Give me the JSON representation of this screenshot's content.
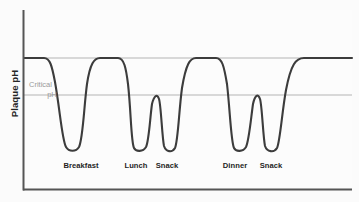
{
  "chart_data": {
    "type": "line",
    "title": "Frequent Consumption",
    "xlabel": "",
    "ylabel": "Plaque pH",
    "grid": false,
    "legend": "none",
    "x_tick_labels": [
      "Breakfast",
      "Lunch",
      "Snack",
      "Dinner",
      "Snack"
    ],
    "x_tick_positions_px": [
      81,
      136,
      167,
      235,
      271
    ],
    "reference_lines": [
      {
        "name": "resting-ph",
        "label": "",
        "y_px": 58,
        "color": "#b4b4b4"
      },
      {
        "name": "critical-ph",
        "label": "Critical pH",
        "y_px": 95,
        "color": "#b4b4b4"
      }
    ],
    "annotations": [
      {
        "name": "critical-ph-annotation",
        "line1": "Critical",
        "line2": "pH",
        "x_px": 41,
        "y_px": 88,
        "color": "#9a9a9a"
      }
    ],
    "series": [
      {
        "name": "plaque-ph-curve",
        "color": "#3c3c3c",
        "width_px": 2.1,
        "description": "Stephan curve: plaque pH drops below the critical pH after each eating event and recovers between events; frequent snacking keeps pH below critical for long periods.",
        "events": [
          {
            "label": "Breakfast",
            "trough_x_px": 72,
            "trough_y_px": 150,
            "recovers_to": "resting"
          },
          {
            "label": "Lunch",
            "trough_x_px": 136,
            "trough_y_px": 150,
            "recovers_to": "critical"
          },
          {
            "label": "Snack",
            "trough_x_px": 168,
            "trough_y_px": 152,
            "recovers_to": "resting"
          },
          {
            "label": "Dinner",
            "trough_x_px": 238,
            "trough_y_px": 150,
            "recovers_to": "critical"
          },
          {
            "label": "Snack",
            "trough_x_px": 272,
            "trough_y_px": 152,
            "recovers_to": "resting"
          }
        ],
        "path": "M 24,58 L 44,58 C 50,58 52,66 55,82 C 60,110 62,140 66,147 C 69,152 76,152 79,147 C 83,139 84,106 87,84 C 90,64 94,58 100,58 L 118,58 C 124,58 126,68 128,84 C 131,110 131,142 134,148 C 136,152 143,152 146,147 C 149,141 150,118 152,104 C 154,96 157,93 159,99 C 161,105 162,136 164,146 C 166,152 172,153 175,148 C 178,142 179,110 182,88 C 186,64 190,58 196,58 L 216,58 C 222,58 224,66 227,84 C 230,110 231,142 234,148 C 236,152 243,152 246,147 C 249,141 251,118 253,104 C 255,95 258,93 260,99 C 262,105 263,136 265,146 C 267,152 274,153 277,148 C 280,142 282,112 286,90 C 291,64 296,58 304,58 L 352,58"
      }
    ],
    "axes": {
      "y_axis": {
        "x_px": 23,
        "y_top_px": 10,
        "y_bottom_px": 190,
        "color": "#555555"
      },
      "x_axis": {
        "y_px": 190,
        "x_left_px": 23,
        "x_right_px": 352,
        "color": "#555555"
      }
    },
    "colors": {
      "background": "#fbfbfb",
      "plot_background": "#fcfcfc",
      "curve": "#3c3c3c",
      "reference_line": "#b4b4b4",
      "axis": "#555555",
      "title_text": "#242424",
      "label_text": "#1f1f1f",
      "annotation_text": "#9a9a9a"
    }
  }
}
